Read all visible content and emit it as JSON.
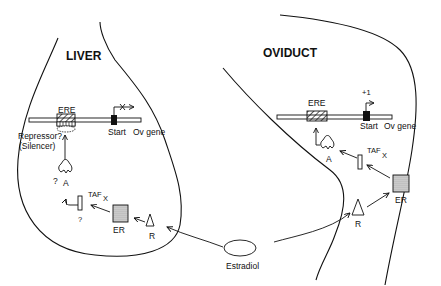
{
  "diagram": {
    "liver": {
      "title": "LIVER",
      "ere_label": "ERE",
      "start_label": "Start",
      "gene_label": "Ov gene",
      "repressor_label": "Repressor?",
      "silencer_label": "(Silencer)",
      "a_label": "A",
      "a_question": "?",
      "taf_label": "TAF",
      "x_label": "X",
      "taf_question": "?",
      "er_label": "ER",
      "r_label": "R",
      "transcription_blocked": true
    },
    "oviduct": {
      "title": "OVIDUCT",
      "ere_label": "ERE",
      "start_label": "Start",
      "gene_label": "Ov gene",
      "plus_one_label": "+1",
      "a_label": "A",
      "taf_label": "TAF",
      "x_label": "X",
      "er_label": "ER",
      "r_label": "R",
      "transcription_blocked": false
    },
    "estradiol_label": "Estradiol",
    "colors": {
      "line": "#111111",
      "er_fill": "#c8c8c8",
      "background": "#ffffff"
    }
  }
}
